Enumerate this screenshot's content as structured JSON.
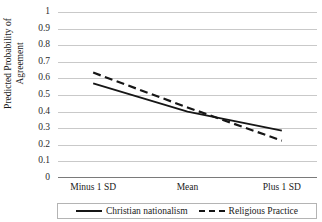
{
  "chart_data": {
    "type": "line",
    "title": "",
    "xlabel": "",
    "ylabel": "Predicted Probability of",
    "ylabel_line2": "Agreement",
    "categories": [
      "Minus 1 SD",
      "Mean",
      "Plus 1 SD"
    ],
    "ylim": [
      0,
      1
    ],
    "ytick_labels": [
      "1",
      "0.9",
      "0.8",
      "0.7",
      "0.6",
      "0.5",
      "0.4",
      "0.3",
      "0.2",
      "0.1",
      "0"
    ],
    "ytick_values": [
      1,
      0.9,
      0.8,
      0.7,
      0.6,
      0.5,
      0.4,
      0.3,
      0.2,
      0.1,
      0
    ],
    "grid": true,
    "legend_position": "bottom",
    "series": [
      {
        "name": "Christian nationalism",
        "style": "solid",
        "color": "#161616",
        "values": [
          0.57,
          0.4,
          0.285
        ]
      },
      {
        "name": "Religious Practice",
        "style": "dashed",
        "color": "#161616",
        "values": [
          0.635,
          0.425,
          0.225
        ]
      }
    ]
  },
  "axes": {
    "y_title_line1": "Predicted Probability of",
    "y_title_line2": "Agreement",
    "x_categories": [
      "Minus 1 SD",
      "Mean",
      "Plus 1 SD"
    ],
    "y_ticks": [
      "1",
      "0.9",
      "0.8",
      "0.7",
      "0.6",
      "0.5",
      "0.4",
      "0.3",
      "0.2",
      "0.1",
      "0"
    ]
  },
  "legend": {
    "entries": [
      {
        "label": "Christian nationalism",
        "style": "solid"
      },
      {
        "label": "Religious Practice",
        "style": "dashed"
      }
    ]
  },
  "title_clipped": ""
}
